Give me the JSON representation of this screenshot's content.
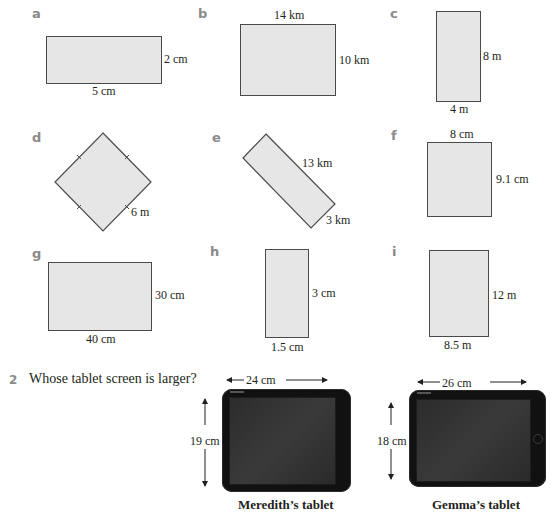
{
  "question1": {
    "parts": [
      {
        "letter": "a",
        "dims": [
          "2 cm",
          "5 cm"
        ]
      },
      {
        "letter": "b",
        "dims": [
          "14 km",
          "10 km"
        ]
      },
      {
        "letter": "c",
        "dims": [
          "8 m",
          "4 m"
        ]
      },
      {
        "letter": "d",
        "dims": [
          "6 m"
        ]
      },
      {
        "letter": "e",
        "dims": [
          "13 km",
          "3 km"
        ]
      },
      {
        "letter": "f",
        "dims": [
          "8 cm",
          "9.1 cm"
        ]
      },
      {
        "letter": "g",
        "dims": [
          "30 cm",
          "40 cm"
        ]
      },
      {
        "letter": "h",
        "dims": [
          "3 cm",
          "1.5 cm"
        ]
      },
      {
        "letter": "i",
        "dims": [
          "12 m",
          "8.5 m"
        ]
      }
    ]
  },
  "question2": {
    "number": "2",
    "text": "Whose tablet screen is larger?",
    "tablets": [
      {
        "width": "24 cm",
        "height": "19 cm",
        "caption": "Meredith’s tablet"
      },
      {
        "width": "26 cm",
        "height": "18 cm",
        "caption": "Gemma’s tablet"
      }
    ]
  },
  "colors": {
    "shape_fill": "#e6e6e6",
    "shape_border": "#4a4a4a",
    "label_letter": "#8a8a8a",
    "tablet_body": "#111111"
  }
}
